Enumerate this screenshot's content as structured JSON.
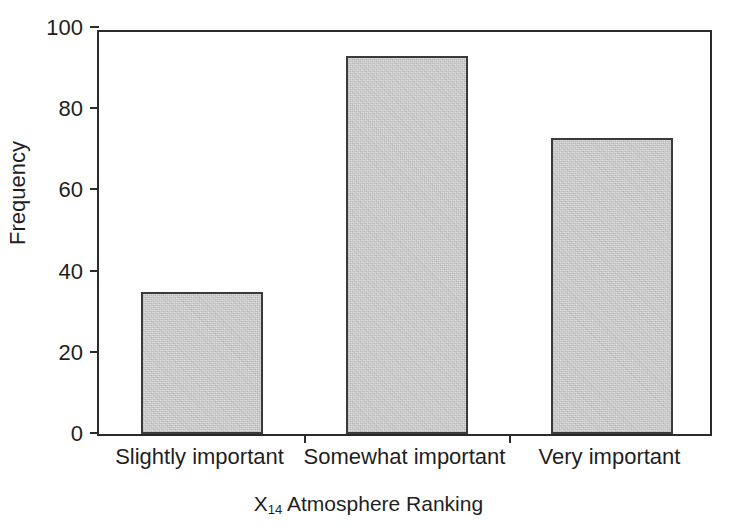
{
  "chart_data": {
    "type": "bar",
    "title": "",
    "subtitle": "",
    "xlabel": "X14 Atmosphere Ranking",
    "xlabel_base": "X",
    "xlabel_subscript": "14",
    "xlabel_rest": " Atmosphere Ranking",
    "ylabel": "Frequency",
    "categories": [
      "Slightly important",
      "Somewhat important",
      "Very important"
    ],
    "values": [
      35,
      93,
      73
    ],
    "ylim": [
      0,
      100
    ],
    "yticks": [
      0,
      20,
      40,
      60,
      80,
      100
    ],
    "ytick_labels": [
      "0",
      "20",
      "40",
      "60",
      "80",
      "100"
    ],
    "grid": false,
    "legend": false,
    "legend_position": "none",
    "bar_fill_color": "#d4d4d4",
    "bar_edge_color": "#3a3a3a",
    "axis_color": "#2b2b2b",
    "background_color": "#ffffff"
  },
  "axes": {
    "y": {
      "ticks": [
        {
          "label": "100",
          "value": 100
        },
        {
          "label": "80",
          "value": 80
        },
        {
          "label": "60",
          "value": 60
        },
        {
          "label": "40",
          "value": 40
        },
        {
          "label": "20",
          "value": 20
        },
        {
          "label": "0",
          "value": 0
        }
      ]
    },
    "x": {
      "categories": [
        {
          "label": "Slightly important",
          "value": 35
        },
        {
          "label": "Somewhat important",
          "value": 93
        },
        {
          "label": "Very important",
          "value": 73
        }
      ]
    }
  }
}
